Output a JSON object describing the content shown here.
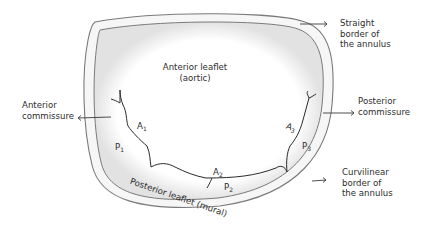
{
  "diagram": {
    "type": "anatomical-illustration",
    "labels": {
      "straight_border": [
        "Straight",
        "border of",
        "the annulus"
      ],
      "curvilinear_border": [
        "Curvilinear",
        "border of",
        "the annulus"
      ],
      "anterior_commissure": [
        "Anterior",
        "commissure"
      ],
      "posterior_commissure": [
        "Posterior",
        "commissure"
      ],
      "anterior_leaflet": [
        "Anterior leaflet",
        "(aortic)"
      ],
      "posterior_leaflet": "Posterior leaflet (mural)"
    },
    "segments": {
      "A1": {
        "letter": "A",
        "index": "1"
      },
      "A2": {
        "letter": "A",
        "index": "2"
      },
      "A3": {
        "letter": "A",
        "index": "3"
      },
      "P1": {
        "letter": "P",
        "index": "1"
      },
      "P2": {
        "letter": "P",
        "index": "2"
      },
      "P3": {
        "letter": "P",
        "index": "3"
      }
    },
    "colors": {
      "outline": "#6e6e6e",
      "ink": "#2b2b2b",
      "shade": "#d9d9d9"
    }
  }
}
